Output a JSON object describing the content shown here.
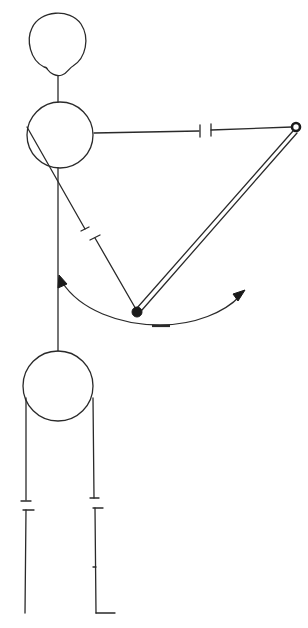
{
  "diagram": {
    "type": "line-drawing",
    "colors": {
      "ink": "#2a2a2a",
      "background": "#ffffff"
    },
    "elements": {
      "head_circle": {
        "cx": 57,
        "cy": 43,
        "r": 30
      },
      "body_circle": {
        "cx": 60,
        "cy": 135,
        "r": 33
      },
      "base_circle": {
        "cx": 58,
        "cy": 386,
        "r": 35
      },
      "pivot_point": {
        "x": 296,
        "y": 127
      },
      "joint_dot": {
        "x": 137,
        "y": 312
      },
      "arc_arrow": {
        "direction": "double-headed",
        "from": [
          60,
          278
        ],
        "to": [
          243,
          293
        ]
      }
    }
  }
}
